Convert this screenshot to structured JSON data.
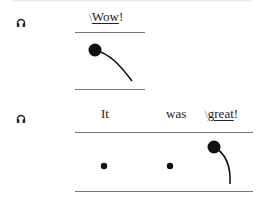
{
  "panel1": {
    "audio_icon": "headphones-icon",
    "words": [
      {
        "prefix": "\\",
        "underlined": "Wow",
        "suffix": "!"
      }
    ]
  },
  "panel2": {
    "audio_icon": "headphones-icon",
    "words": [
      {
        "text": "It"
      },
      {
        "text": "was"
      },
      {
        "prefix": "\\",
        "underlined": "great",
        "suffix": "!"
      }
    ]
  }
}
